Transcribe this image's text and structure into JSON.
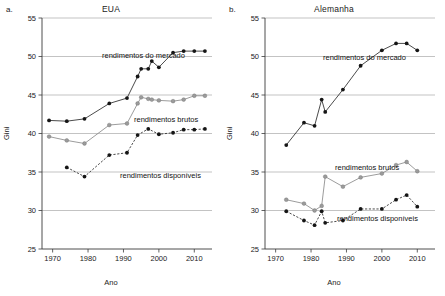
{
  "figure": {
    "xlabel": "Ano",
    "ylabel": "Gini"
  },
  "panels": [
    {
      "letter": "a.",
      "title": "EUA"
    },
    {
      "letter": "b.",
      "title": "Alemanha"
    }
  ],
  "axis": {
    "y_ticks": [
      "25",
      "30",
      "35",
      "40",
      "45",
      "50",
      "55"
    ],
    "x_ticks": [
      "1970",
      "1980",
      "1990",
      "2000",
      "2010"
    ]
  },
  "annotations": {
    "market": "rendimentos do mercado",
    "gross": "rendimentos brutos",
    "disposable": "rendimentos disponíveis"
  },
  "chart_data": [
    {
      "type": "line",
      "title": "EUA",
      "xlabel": "Ano",
      "ylabel": "Gini",
      "xlim": [
        1967,
        2015
      ],
      "ylim": [
        25,
        55
      ],
      "y_ticks": [
        25,
        30,
        35,
        40,
        45,
        50,
        55
      ],
      "x_ticks": [
        1970,
        1980,
        1990,
        2000,
        2010
      ],
      "grid": true,
      "legend": "inline-annotations",
      "series": [
        {
          "name": "rendimentos do mercado",
          "style": "solid-dark",
          "x": [
            1969,
            1974,
            1979,
            1986,
            1991,
            1994,
            1995,
            1997,
            1998,
            2000,
            2004,
            2007,
            2010,
            2013
          ],
          "y": [
            41.7,
            41.6,
            41.9,
            43.9,
            44.6,
            47.4,
            48.4,
            48.4,
            49.4,
            48.6,
            50.5,
            50.7,
            50.7,
            50.7
          ]
        },
        {
          "name": "rendimentos brutos",
          "style": "solid-grey",
          "x": [
            1969,
            1974,
            1979,
            1986,
            1991,
            1994,
            1995,
            1997,
            1998,
            2000,
            2004,
            2007,
            2010,
            2013
          ],
          "y": [
            39.6,
            39.1,
            38.7,
            41.1,
            41.3,
            43.9,
            44.7,
            44.5,
            44.4,
            44.3,
            44.2,
            44.4,
            44.9,
            44.9
          ]
        },
        {
          "name": "rendimentos disponíveis",
          "style": "dashed-dark",
          "x": [
            1974,
            1979,
            1986,
            1991,
            1994,
            1997,
            2000,
            2004,
            2007,
            2010,
            2013
          ],
          "y": [
            35.6,
            34.4,
            37.2,
            37.5,
            39.8,
            40.6,
            39.9,
            40.1,
            40.5,
            40.5,
            40.6
          ]
        }
      ]
    },
    {
      "type": "line",
      "title": "Alemanha",
      "xlabel": "Ano",
      "ylabel": "Gini",
      "xlim": [
        1967,
        2015
      ],
      "ylim": [
        25,
        55
      ],
      "y_ticks": [
        25,
        30,
        35,
        40,
        45,
        50,
        55
      ],
      "x_ticks": [
        1970,
        1980,
        1990,
        2000,
        2010
      ],
      "grid": true,
      "legend": "inline-annotations",
      "series": [
        {
          "name": "rendimentos do mercado",
          "style": "solid-dark",
          "x": [
            1973,
            1978,
            1981,
            1983,
            1984,
            1989,
            1994,
            2000,
            2004,
            2007,
            2010
          ],
          "y": [
            38.5,
            41.4,
            41.0,
            44.4,
            42.8,
            45.7,
            48.8,
            50.8,
            51.7,
            51.7,
            50.8
          ]
        },
        {
          "name": "rendimentos brutos",
          "style": "solid-grey",
          "x": [
            1973,
            1978,
            1981,
            1983,
            1984,
            1989,
            1994,
            2000,
            2004,
            2007,
            2010
          ],
          "y": [
            31.4,
            30.9,
            30.0,
            30.6,
            34.4,
            33.1,
            34.3,
            34.8,
            35.9,
            36.3,
            35.1
          ]
        },
        {
          "name": "rendimentos disponíveis",
          "style": "dashed-dark",
          "x": [
            1973,
            1978,
            1981,
            1983,
            1984,
            1989,
            1994,
            2000,
            2004,
            2007,
            2010
          ],
          "y": [
            29.9,
            28.7,
            28.1,
            29.9,
            28.4,
            28.7,
            30.2,
            30.2,
            31.4,
            32.0,
            30.5
          ]
        }
      ]
    }
  ]
}
